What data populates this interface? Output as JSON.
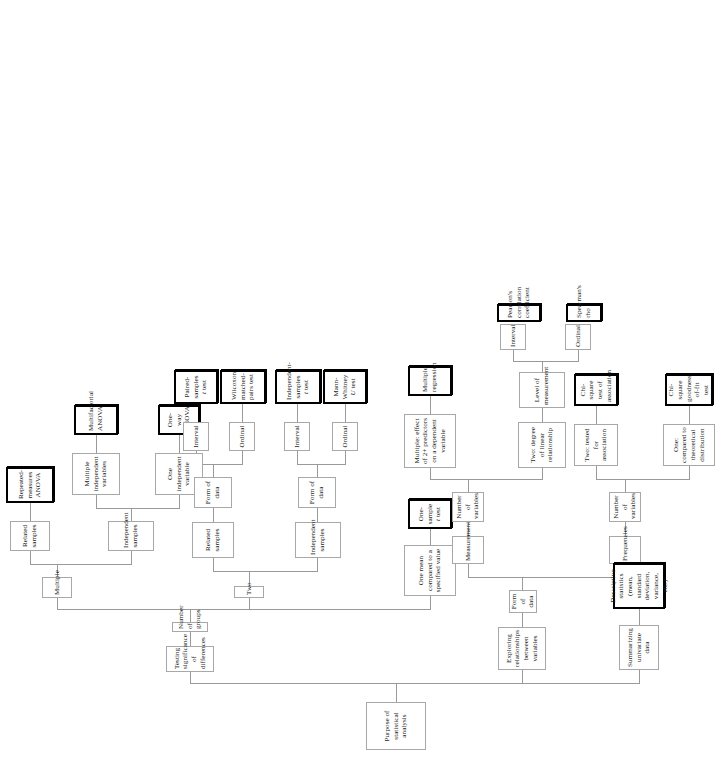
{
  "diagram": {
    "title": "Purpose of statistical analysis",
    "type": "decision-tree",
    "orientation": "rotated-90-ccw",
    "colors": {
      "node_border": "#a8a8a8",
      "terminal_border": "#000000",
      "edge": "#9a9a9a",
      "background": "#ffffff",
      "text": "#1a1a1a"
    }
  },
  "nodes": {
    "root": "Purpose of statistical analysis",
    "testing_significance": "Testing significance of differences",
    "number_of_groups": "Number of groups",
    "multiple": "Multiple",
    "mult_related_samples": "Related samples",
    "repeated_measures_anova": "Repeated-measures ANOVA",
    "mult_independent_samples": "Independent samples",
    "multiple_iv": "Multiple independent variables",
    "multifactorial_anova": "Multifactorial ANOVA",
    "one_iv": "One independent variable",
    "one_way_anova": "One-way ANOVA",
    "two": "Two",
    "two_related_samples": "Related samples",
    "two_related_form_of_data": "Form of data",
    "two_related_interval": "Interval",
    "paired_samples_t": "Paired-samples t test",
    "two_related_ordinal": "Ordinal",
    "wilcoxon": "Wilcoxon matched-pairs test",
    "two_independent_samples": "Independent samples",
    "two_indep_form_of_data": "Form of data",
    "two_indep_interval": "Interval",
    "independent_samples_t": "Independent-samples t test",
    "two_indep_ordinal": "Ordinal",
    "mann_whitney": "Mann-Whitney U test",
    "one_mean": "One mean compared to a specified value",
    "one_sample_t": "One-sample t test",
    "exploring_relationships": "Exploring relationships between variables",
    "explore_form_of_data": "Form of data",
    "measurements": "Measurements",
    "meas_number_of_variables": "Number of variables",
    "multiple_predictors": "Multiple: effect of 2+ predictors on a dependent variable",
    "multiple_regression": "Multiple regression",
    "two_degree_linear": "Two: degree of linear relationship",
    "level_of_measurement": "Level of measurement",
    "lom_interval": "Interval",
    "pearsons_r": "Pearson's correlation coefficient",
    "lom_ordinal": "Ordinal",
    "spearmans_rho": "Spearman's rho",
    "frequencies": "Frequencies",
    "freq_number_of_variables": "Number of variables",
    "two_tested_association": "Two: tested for association",
    "chi_square_association": "Chi-square test of association",
    "one_theoretical": "One: compared to theoretical distribution",
    "chi_square_gof": "Chi-square goodness-of-fit test",
    "summarizing_univariate": "Summarizing univariate data",
    "descriptive_statistics": "Descriptive statistics (mean, standard deviation, variance, etc.)"
  },
  "italic_fragments": {
    "paired_samples_t": "t",
    "independent_samples_t": "t",
    "mann_whitney": "U",
    "one_sample_t": "t"
  }
}
